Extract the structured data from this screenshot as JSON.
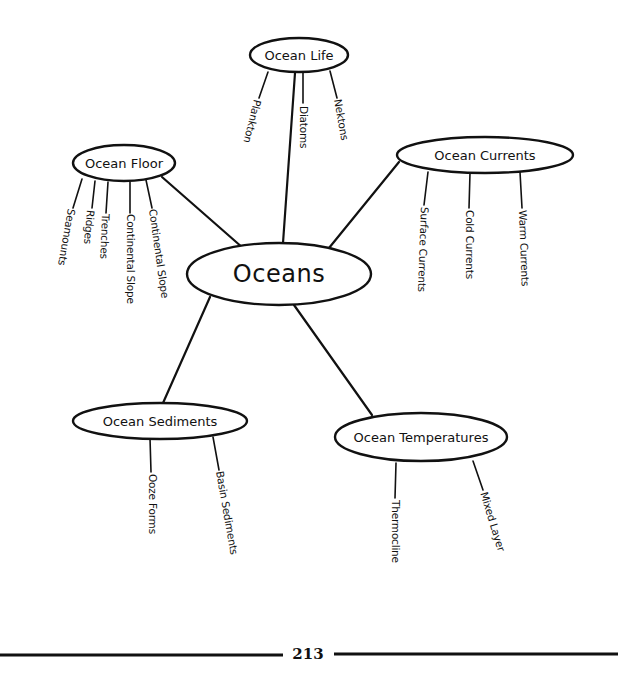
{
  "diagram": {
    "type": "mind-map",
    "root": {
      "label": "Oceans",
      "cx": 279,
      "cy": 274,
      "rx": 92,
      "ry": 31
    },
    "branches": [
      {
        "label": "Ocean Life",
        "cx": 299,
        "cy": 55,
        "rx": 49,
        "ry": 17,
        "link": [
          295,
          73,
          283,
          243
        ],
        "leaves": [
          {
            "label": "Plankton",
            "line": [
              268,
              72,
              259,
              98
            ],
            "text_x": 258,
            "text_y": 100,
            "angle": 104
          },
          {
            "label": "Diatoms",
            "line": [
              303,
              73,
              303,
              103
            ],
            "text_x": 304,
            "text_y": 106,
            "angle": 90
          },
          {
            "label": "Nektons",
            "line": [
              330,
              71,
              337,
              98
            ],
            "text_x": 338,
            "text_y": 99,
            "angle": 80
          }
        ]
      },
      {
        "label": "Ocean Floor",
        "cx": 124,
        "cy": 163,
        "rx": 51,
        "ry": 18,
        "link": [
          162,
          177,
          243,
          248
        ],
        "leaves": [
          {
            "label": "Seamounts",
            "line": [
              82,
              179,
              73,
              208
            ],
            "text_x": 72,
            "text_y": 209,
            "angle": 100
          },
          {
            "label": "Ridges",
            "line": [
              95,
              181,
              92,
              208
            ],
            "text_x": 91,
            "text_y": 210,
            "angle": 95
          },
          {
            "label": "Trenches",
            "line": [
              108,
              182,
              106,
              213
            ],
            "text_x": 106,
            "text_y": 214,
            "angle": 92
          },
          {
            "label": "Continental Slope",
            "line": [
              130,
              182,
              130,
              213
            ],
            "text_x": 131,
            "text_y": 214,
            "angle": 90
          },
          {
            "label": "Continental Slope",
            "line": [
              146,
              180,
              152,
              208
            ],
            "text_x": 153,
            "text_y": 209,
            "angle": 82
          }
        ]
      },
      {
        "label": "Ocean Currents",
        "cx": 485,
        "cy": 155,
        "rx": 88,
        "ry": 18,
        "link": [
          399,
          162,
          329,
          248
        ],
        "leaves": [
          {
            "label": "Surface Currents",
            "line": [
              428,
              172,
              424,
              205
            ],
            "text_x": 425,
            "text_y": 207,
            "angle": 92
          },
          {
            "label": "Cold Currents",
            "line": [
              470,
              173,
              469,
              208
            ],
            "text_x": 470,
            "text_y": 210,
            "angle": 90
          },
          {
            "label": "Warm Currents",
            "line": [
              520,
              172,
              522,
              208
            ],
            "text_x": 523,
            "text_y": 210,
            "angle": 88
          }
        ]
      },
      {
        "label": "Ocean Sediments",
        "cx": 160,
        "cy": 421,
        "rx": 87,
        "ry": 18,
        "link": [
          210,
          297,
          163,
          403
        ],
        "leaves": [
          {
            "label": "Ooze Forms",
            "line": [
              150,
              438,
              151,
              472
            ],
            "text_x": 153,
            "text_y": 474,
            "angle": 90
          },
          {
            "label": "Basin Sediments",
            "line": [
              213,
              437,
              219,
              470
            ],
            "text_x": 220,
            "text_y": 471,
            "angle": 80
          }
        ]
      },
      {
        "label": "Ocean Temperatures",
        "cx": 421,
        "cy": 437,
        "rx": 86,
        "ry": 24,
        "link": [
          294,
          305,
          372,
          415
        ],
        "leaves": [
          {
            "label": "Thermocline",
            "line": [
              396,
              463,
              395,
              498
            ],
            "text_x": 396,
            "text_y": 500,
            "angle": 90
          },
          {
            "label": "Mixed Layer",
            "line": [
              473,
              461,
              483,
              490
            ],
            "text_x": 484,
            "text_y": 492,
            "angle": 73
          }
        ]
      }
    ]
  },
  "footer": {
    "page_number": "213"
  },
  "colors": {
    "ink": "#111111",
    "background": "#ffffff"
  }
}
